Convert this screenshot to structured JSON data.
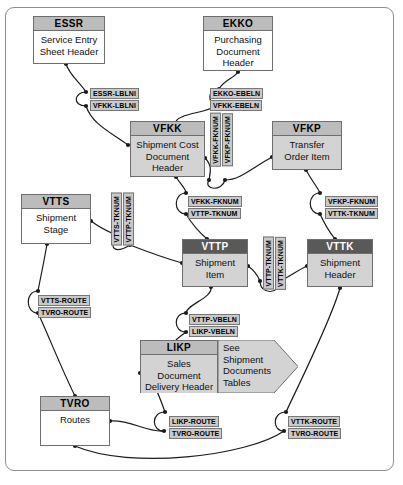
{
  "diagram": {
    "frame_color": "#8d8d8d",
    "header_color": "#bcbcbc",
    "header_dark_color": "#595959",
    "shaded_body_color": "#d3d3d3",
    "label_color": "#c9c9c9"
  },
  "entities": [
    {
      "key": "ESSR",
      "name": "ESSR",
      "desc": "Service Entry\nSheet Header",
      "x": 33,
      "y": 16,
      "w": 72,
      "h": 48,
      "style": "plain"
    },
    {
      "key": "EKKO",
      "name": "EKKO",
      "desc": "Purchasing\nDocument\nHeader",
      "x": 203,
      "y": 16,
      "w": 70,
      "h": 55,
      "style": "plain"
    },
    {
      "key": "VFKK",
      "name": "VFKK",
      "desc": "Shipment Cost\nDocument\nHeader",
      "x": 130,
      "y": 121,
      "w": 75,
      "h": 56,
      "style": "shaded"
    },
    {
      "key": "VFKP",
      "name": "VFKP",
      "desc": "Transfer\nOrder Item",
      "x": 272,
      "y": 121,
      "w": 70,
      "h": 49,
      "style": "shaded"
    },
    {
      "key": "VTTS",
      "name": "VTTS",
      "desc": "Shipment\nStage",
      "x": 21,
      "y": 194,
      "w": 70,
      "h": 50,
      "style": "plain"
    },
    {
      "key": "VTTP",
      "name": "VTTP",
      "desc": "Shipment\nItem",
      "x": 182,
      "y": 239,
      "w": 66,
      "h": 48,
      "style": "shaded dark"
    },
    {
      "key": "VTTK",
      "name": "VTTK",
      "desc": "Shipment\nHeader",
      "x": 307,
      "y": 239,
      "w": 66,
      "h": 48,
      "style": "shaded dark"
    },
    {
      "key": "LIKP",
      "name": "LIKP",
      "desc": "Sales\nDocument\nDelivery Header",
      "x": 140,
      "y": 340,
      "w": 78,
      "h": 53,
      "style": "shaded"
    },
    {
      "key": "TVRO",
      "name": "TVRO",
      "desc": "Routes",
      "x": 40,
      "y": 396,
      "w": 70,
      "h": 50,
      "style": "plain"
    }
  ],
  "callout": {
    "name": "see-shipment-documents-tables",
    "text": "See\nShipment\nDocuments\nTables",
    "x": 218,
    "y": 340,
    "w": 80,
    "h": 53
  },
  "relationship_labels": [
    {
      "text": "ESSR-LBLNI",
      "x": 90,
      "y": 88,
      "orient": "h"
    },
    {
      "text": "VFKK-LBLNI",
      "x": 90,
      "y": 100,
      "orient": "h"
    },
    {
      "text": "EKKO-EBELN",
      "x": 210,
      "y": 88,
      "orient": "h"
    },
    {
      "text": "VFKK-EBELN",
      "x": 210,
      "y": 100,
      "orient": "h"
    },
    {
      "text": "VFKK-FKNUM",
      "x": 210,
      "y": 113,
      "orient": "v"
    },
    {
      "text": "VFKP-FKNUM",
      "x": 222,
      "y": 113,
      "orient": "v"
    },
    {
      "text": "VFKK-FKNUM",
      "x": 188,
      "y": 196,
      "orient": "h"
    },
    {
      "text": "VTTP-TKNUM",
      "x": 188,
      "y": 208,
      "orient": "h"
    },
    {
      "text": "VFKP-FKNUM",
      "x": 325,
      "y": 196,
      "orient": "h"
    },
    {
      "text": "VTTK-TKNUM",
      "x": 325,
      "y": 208,
      "orient": "h"
    },
    {
      "text": "VTTS-TKNUM",
      "x": 111,
      "y": 193,
      "orient": "v"
    },
    {
      "text": "VTTP-TKNUM",
      "x": 123,
      "y": 193,
      "orient": "v"
    },
    {
      "text": "VTTP-TKNUM",
      "x": 263,
      "y": 237,
      "orient": "v"
    },
    {
      "text": "VTTK-TKNUM",
      "x": 275,
      "y": 237,
      "orient": "v"
    },
    {
      "text": "VTTS-ROUTE",
      "x": 38,
      "y": 295,
      "orient": "h"
    },
    {
      "text": "TVRO-ROUTE",
      "x": 38,
      "y": 307,
      "orient": "h"
    },
    {
      "text": "VTTP-VBELN",
      "x": 189,
      "y": 314,
      "orient": "h"
    },
    {
      "text": "LIKP-VBELN",
      "x": 189,
      "y": 326,
      "orient": "h"
    },
    {
      "text": "LIKP-ROUTE",
      "x": 169,
      "y": 416,
      "orient": "h"
    },
    {
      "text": "TVRO-ROUTE",
      "x": 169,
      "y": 428,
      "orient": "h"
    },
    {
      "text": "VTTK-ROUTE",
      "x": 288,
      "y": 416,
      "orient": "h"
    },
    {
      "text": "TVRO-ROUTE",
      "x": 288,
      "y": 428,
      "orient": "h"
    }
  ],
  "connectors": [
    {
      "from": "ESSR",
      "to": "VFKK",
      "path": "M66,64 C70,78 80,82 86,92"
    },
    {
      "from": "ESSR-rel",
      "to": "VFKK",
      "path": "M86,105 C92,122 110,130 128,144"
    },
    {
      "arc": "M86,92 C76,92 74,105 86,105"
    },
    {
      "from": "EKKO",
      "to": "VFKK",
      "path": "M237,71 C232,79 224,80 219,90"
    },
    {
      "from": "EKKO-rel",
      "to": "VFKK",
      "path": "M209,104 C200,112 184,112 177,122"
    },
    {
      "arc2": "M209,90 C199,90 199,104 209,104"
    },
    {
      "from": "VFKK",
      "to": "VFKP",
      "path": "M205,160 C214,168 210,178 208,180"
    },
    {
      "from": "VFKP",
      "to": "VFKK",
      "path": "M225,180 C238,182 250,170 272,158"
    },
    {
      "arc3": "M208,180 C208,192 225,192 225,180"
    },
    {
      "from": "VFKK",
      "to": "VTTP",
      "path": "M177,177 C182,187 186,190 186,192"
    },
    {
      "from": "rel",
      "to": "VTTP",
      "path": "M186,213 C191,222 200,232 207,239"
    },
    {
      "arc4": "M186,192 C174,192 174,213 186,213"
    },
    {
      "from": "VFKP",
      "to": "VTTK",
      "path": "M306,170 C311,182 318,188 320,192"
    },
    {
      "from": "rel",
      "to": "VTTK",
      "path": "M320,213 C324,224 330,234 334,239"
    },
    {
      "arc5": "M320,192 C308,192 308,213 320,213"
    },
    {
      "from": "VTTS",
      "to": "VTTP",
      "path": "M91,221 C105,232 112,234 118,236"
    },
    {
      "from": "rel",
      "to": "VTTP",
      "path": "M133,241 C150,248 168,258 182,262"
    },
    {
      "arc6": "M118,236 C109,248 123,252 133,241"
    },
    {
      "from": "VTTP",
      "to": "VTTK",
      "path": "M248,266 C255,272 258,276 260,280"
    },
    {
      "from": "rel",
      "to": "VTTK",
      "path": "M279,280 C288,276 297,270 307,266"
    },
    {
      "arc7": "M260,280 C260,294 279,294 279,280"
    },
    {
      "from": "VTTS",
      "to": "TVRO",
      "path": "M47,244 C44,264 40,280 38,290"
    },
    {
      "from": "rel",
      "to": "TVRO",
      "path": "M38,312 C48,330 62,370 75,396"
    },
    {
      "arc8": "M38,290 C26,290 26,312 38,312"
    },
    {
      "from": "VTTP",
      "to": "LIKP",
      "path": "M210,287 C212,300 186,306 186,312"
    },
    {
      "from": "rel",
      "to": "LIKP",
      "path": "M186,332 C180,336 178,338 176,340"
    },
    {
      "arc9": "M186,312 C174,312 174,332 186,332"
    },
    {
      "from": "LIKP",
      "to": "TVRO-rel",
      "path": "M140,373 C152,372 160,396 166,412"
    },
    {
      "from": "TVRO",
      "to": "rel",
      "path": "M110,421 C130,420 152,432 163,430"
    },
    {
      "arc10": "M166,412 C152,412 152,430 163,430"
    },
    {
      "from": "VTTK",
      "to": "TVRO-rel2",
      "path": "M340,287 C330,320 300,380 285,412"
    },
    {
      "from": "TVRO",
      "to": "rel2",
      "path": "M75,446 C140,470 250,450 283,430"
    },
    {
      "arc11": "M285,412 C272,412 272,430 283,430"
    }
  ]
}
